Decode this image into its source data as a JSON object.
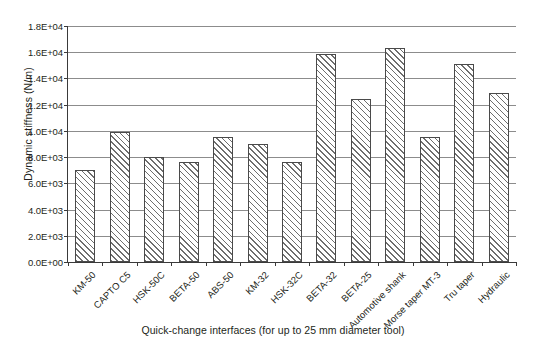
{
  "chart_data": {
    "type": "bar",
    "title": "",
    "xlabel": "Quick-change interfaces (for up to 25 mm diameter tool)",
    "ylabel": "Dynamic stiffness (N/m)",
    "ylim": [
      0,
      18000
    ],
    "ytick_step": 2000,
    "ytick_labels": [
      "0.0E+00",
      "2.0E+03",
      "4.0E+03",
      "6.0E+03",
      "8.0E+03",
      "1.0E+04",
      "1.2E+04",
      "1.4E+04",
      "1.6E+04",
      "1.8E+04"
    ],
    "ytick_values": [
      0,
      2000,
      4000,
      6000,
      8000,
      10000,
      12000,
      14000,
      16000,
      18000
    ],
    "grid": true,
    "legend": false,
    "legend_position": "none",
    "bar_fill": "diagonal-hatch",
    "bar_edge_color": "#4a4a4a",
    "gridline_color": "#8c8c8c",
    "axis_color": "#3a3a3a",
    "categories": [
      "KM-50",
      "CAPTO C5",
      "HSK-50C",
      "BETA-50",
      "ABS-50",
      "KM-32",
      "HSK-32C",
      "BETA-32",
      "BETA-25",
      "Automotive shank",
      "Morse taper MT-3",
      "Tru taper",
      "Hydraulic"
    ],
    "values": [
      7000,
      9900,
      8000,
      7600,
      9500,
      9000,
      7600,
      15900,
      12400,
      16300,
      9500,
      15100,
      12900
    ]
  }
}
